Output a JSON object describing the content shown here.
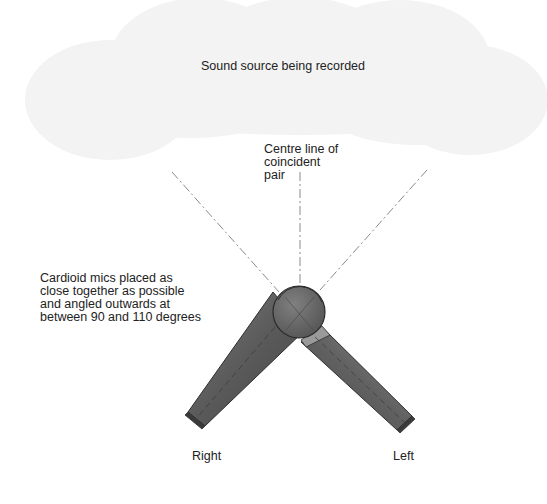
{
  "diagram": {
    "source_label": "Sound source being recorded",
    "centre_label": "Centre line of\ncoincident\npair",
    "mics_label": "Cardioid mics placed as\nclose together as possible\nand angled outwards at\nbetween 90 and 110 degrees",
    "right_mic_label": "Right",
    "left_mic_label": "Left",
    "colors": {
      "cloud": "#f4f4f4",
      "mic_body_dark": "#4a4a4a",
      "mic_body_light": "#7a7a7a",
      "capsule": "#6a6a6a",
      "line": "#888888"
    }
  }
}
